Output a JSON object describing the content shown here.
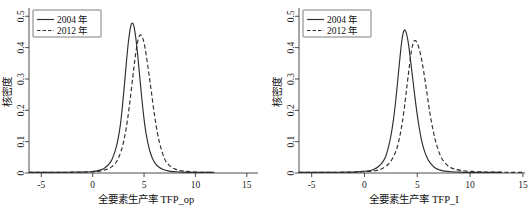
{
  "figure": {
    "panel_count": 2,
    "background_color": "#ffffff",
    "line_color": "#2e2e2e"
  },
  "chart_data": [
    {
      "id": "tfp_op",
      "type": "line",
      "title": "",
      "xlabel": "全要素生产率 TFP_op",
      "ylabel": "核密度",
      "xlim": [
        -6.2,
        15.8
      ],
      "ylim": [
        0,
        0.52
      ],
      "xticks": [
        -5,
        0,
        5,
        10,
        15
      ],
      "xticklabels": [
        "-5",
        "0",
        "5",
        "10",
        "15"
      ],
      "yticks": [
        0,
        0.1,
        0.2,
        0.3,
        0.4,
        0.5
      ],
      "yticklabels": [
        "0",
        "0.1",
        "0.2",
        "0.3",
        "0.4",
        "0.5"
      ],
      "grid": false,
      "legend_position": "upper-left",
      "series": [
        {
          "name": "2004 年",
          "style": "solid",
          "peak_x": 3.85,
          "peak_y": 0.478,
          "x": [
            -6.2,
            -5.0,
            -4.0,
            -3.0,
            -2.0,
            -1.0,
            -0.2,
            0.3,
            0.8,
            1.2,
            1.6,
            1.9,
            2.2,
            2.45,
            2.7,
            2.9,
            3.1,
            3.3,
            3.5,
            3.7,
            3.85,
            4.0,
            4.2,
            4.4,
            4.6,
            4.8,
            5.0,
            5.2,
            5.5,
            5.8,
            6.1,
            6.4,
            6.8,
            7.2,
            7.6,
            8.1,
            8.7,
            9.4,
            10.2,
            11.0,
            11.8
          ],
          "y": [
            0.002,
            0.002,
            0.002,
            0.002,
            0.003,
            0.003,
            0.004,
            0.006,
            0.01,
            0.017,
            0.029,
            0.045,
            0.072,
            0.105,
            0.155,
            0.215,
            0.285,
            0.36,
            0.425,
            0.468,
            0.478,
            0.47,
            0.43,
            0.37,
            0.3,
            0.232,
            0.172,
            0.125,
            0.078,
            0.048,
            0.03,
            0.02,
            0.012,
            0.008,
            0.005,
            0.004,
            0.003,
            0.002,
            0.002,
            0.002,
            0.002
          ]
        },
        {
          "name": "2012 年",
          "style": "dashed",
          "peak_x": 4.62,
          "peak_y": 0.44,
          "x": [
            -6.2,
            -5.0,
            -4.0,
            -3.0,
            -2.0,
            -1.0,
            -0.2,
            0.4,
            1.0,
            1.5,
            1.9,
            2.3,
            2.6,
            2.9,
            3.15,
            3.4,
            3.65,
            3.9,
            4.1,
            4.3,
            4.45,
            4.62,
            4.8,
            5.0,
            5.2,
            5.45,
            5.7,
            6.0,
            6.3,
            6.6,
            7.0,
            7.4,
            7.9,
            8.5,
            9.2,
            10.0,
            10.8,
            11.8
          ],
          "y": [
            0.002,
            0.002,
            0.002,
            0.002,
            0.002,
            0.003,
            0.004,
            0.005,
            0.008,
            0.013,
            0.021,
            0.035,
            0.055,
            0.085,
            0.122,
            0.172,
            0.235,
            0.305,
            0.36,
            0.405,
            0.428,
            0.44,
            0.436,
            0.415,
            0.378,
            0.322,
            0.262,
            0.188,
            0.128,
            0.085,
            0.045,
            0.026,
            0.014,
            0.008,
            0.005,
            0.003,
            0.002,
            0.002
          ]
        }
      ]
    },
    {
      "id": "tfp_i",
      "type": "line",
      "title": "",
      "xlabel": "全要素生产率 TFP_I",
      "ylabel": "核密度",
      "xlim": [
        -6.2,
        15.2
      ],
      "ylim": [
        0,
        0.52
      ],
      "xticks": [
        -5,
        0,
        5,
        10,
        15
      ],
      "xticklabels": [
        "-5",
        "0",
        "5",
        "10",
        "15"
      ],
      "yticks": [
        0,
        0.1,
        0.2,
        0.3,
        0.4,
        0.5
      ],
      "yticklabels": [
        "0",
        "0.1",
        "0.2",
        "0.3",
        "0.4",
        "0.5"
      ],
      "grid": false,
      "legend_position": "upper-left",
      "series": [
        {
          "name": "2004 年",
          "style": "solid",
          "peak_x": 3.75,
          "peak_y": 0.455,
          "x": [
            -6.2,
            -5.0,
            -4.0,
            -3.0,
            -2.0,
            -1.0,
            -0.2,
            0.4,
            0.9,
            1.3,
            1.7,
            2.0,
            2.25,
            2.5,
            2.75,
            2.95,
            3.15,
            3.35,
            3.55,
            3.75,
            3.95,
            4.15,
            4.35,
            4.6,
            4.85,
            5.1,
            5.4,
            5.7,
            6.0,
            6.3,
            6.7,
            7.1,
            7.6,
            8.2,
            8.9,
            9.8,
            10.8,
            12.0,
            13.0
          ],
          "y": [
            0.002,
            0.002,
            0.002,
            0.002,
            0.003,
            0.003,
            0.005,
            0.007,
            0.012,
            0.02,
            0.034,
            0.052,
            0.08,
            0.118,
            0.172,
            0.228,
            0.295,
            0.365,
            0.425,
            0.455,
            0.448,
            0.415,
            0.362,
            0.292,
            0.222,
            0.162,
            0.105,
            0.068,
            0.044,
            0.029,
            0.016,
            0.01,
            0.006,
            0.004,
            0.003,
            0.002,
            0.002,
            0.002,
            0.002
          ]
        },
        {
          "name": "2012 年",
          "style": "dashed",
          "peak_x": 4.72,
          "peak_y": 0.422,
          "x": [
            -6.2,
            -5.0,
            -4.0,
            -3.0,
            -2.0,
            -1.0,
            -0.2,
            0.5,
            1.1,
            1.6,
            2.1,
            2.5,
            2.85,
            3.1,
            3.35,
            3.6,
            3.85,
            4.05,
            4.25,
            4.45,
            4.6,
            4.72,
            4.9,
            5.1,
            5.35,
            5.6,
            5.9,
            6.2,
            6.55,
            6.9,
            7.3,
            7.8,
            8.4,
            9.2,
            10.2,
            11.4,
            12.6,
            13.8,
            15.0
          ],
          "y": [
            0.002,
            0.002,
            0.002,
            0.002,
            0.002,
            0.003,
            0.004,
            0.005,
            0.008,
            0.013,
            0.023,
            0.038,
            0.06,
            0.082,
            0.118,
            0.165,
            0.228,
            0.285,
            0.34,
            0.39,
            0.412,
            0.422,
            0.42,
            0.405,
            0.372,
            0.325,
            0.258,
            0.19,
            0.128,
            0.082,
            0.048,
            0.026,
            0.014,
            0.008,
            0.005,
            0.003,
            0.003,
            0.002,
            0.002
          ]
        }
      ]
    }
  ]
}
